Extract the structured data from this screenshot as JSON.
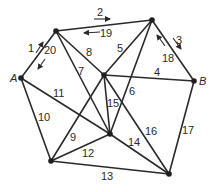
{
  "diagram": {
    "type": "graph",
    "nodes": [
      {
        "id": "A",
        "label": "A",
        "x": 21,
        "y": 78
      },
      {
        "id": "TL",
        "label": "",
        "x": 56,
        "y": 31
      },
      {
        "id": "TR",
        "label": "",
        "x": 152,
        "y": 20
      },
      {
        "id": "C",
        "label": "",
        "x": 104,
        "y": 75
      },
      {
        "id": "B",
        "label": "B",
        "x": 194,
        "y": 81
      },
      {
        "id": "LC",
        "label": "",
        "x": 110,
        "y": 134
      },
      {
        "id": "BL",
        "label": "",
        "x": 51,
        "y": 161
      },
      {
        "id": "BR",
        "label": "",
        "x": 169,
        "y": 174
      }
    ],
    "edges": [
      {
        "from": "A",
        "to": "TL",
        "labels": [
          "1",
          "20"
        ]
      },
      {
        "from": "TL",
        "to": "TR",
        "labels": [
          "2",
          "19"
        ]
      },
      {
        "from": "TR",
        "to": "B",
        "labels": [
          "3",
          "18"
        ]
      },
      {
        "from": "C",
        "to": "B",
        "labels": [
          "4"
        ]
      },
      {
        "from": "C",
        "to": "TR",
        "labels": [
          "5"
        ]
      },
      {
        "from": "TR",
        "to": "LC",
        "labels": [
          "6"
        ]
      },
      {
        "from": "TL",
        "to": "LC",
        "labels": [
          "7"
        ]
      },
      {
        "from": "TL",
        "to": "C",
        "labels": [
          "8"
        ]
      },
      {
        "from": "BL",
        "to": "C",
        "labels": [
          "9"
        ]
      },
      {
        "from": "A",
        "to": "BL",
        "labels": [
          "10"
        ]
      },
      {
        "from": "A",
        "to": "LC",
        "labels": [
          "11"
        ]
      },
      {
        "from": "BL",
        "to": "LC",
        "labels": [
          "12"
        ]
      },
      {
        "from": "BL",
        "to": "BR",
        "labels": [
          "13"
        ]
      },
      {
        "from": "LC",
        "to": "BR",
        "labels": [
          "14"
        ]
      },
      {
        "from": "C",
        "to": "LC",
        "labels": [
          "15"
        ]
      },
      {
        "from": "C",
        "to": "BR",
        "labels": [
          "16"
        ]
      },
      {
        "from": "B",
        "to": "BR",
        "labels": [
          "17"
        ]
      }
    ],
    "edge_labels": {
      "e1": "1",
      "e2": "2",
      "e3": "3",
      "e4": "4",
      "e5": "5",
      "e6": "6",
      "e7": "7",
      "e8": "8",
      "e9": "9",
      "e10": "10",
      "e11": "11",
      "e12": "12",
      "e13": "13",
      "e14": "14",
      "e15": "15",
      "e16": "16",
      "e17": "17",
      "e18": "18",
      "e19": "19",
      "e20": "20"
    },
    "node_labels": {
      "A": "A",
      "B": "B"
    }
  }
}
